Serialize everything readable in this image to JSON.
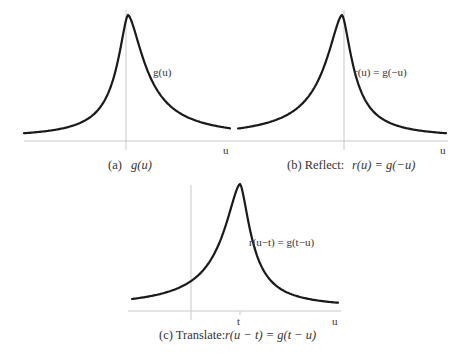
{
  "panels": [
    {
      "id": "a",
      "curve_label": "g(u)",
      "axis_label": "u",
      "caption_prefix": "(a)",
      "caption_math": "g(u)",
      "transform": "original"
    },
    {
      "id": "b",
      "curve_label": "r(u) = g(−u)",
      "axis_label": "u",
      "caption_prefix": "(b) Reflect:",
      "caption_math": "r(u) = g(−u)",
      "transform": "reflect"
    },
    {
      "id": "c",
      "curve_label": "r(u−t) = g(t−u)",
      "axis_label": "u",
      "tick_label": "t",
      "caption_prefix": "(c) Translate:",
      "caption_math": "r(u − t) = g(t − u)",
      "transform": "reflect-and-translate"
    }
  ],
  "colors": {
    "curve": "#1a1a1a",
    "axis": "#c8c8c8",
    "text": "#333333"
  }
}
